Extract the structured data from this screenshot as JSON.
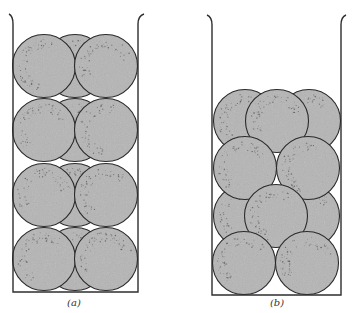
{
  "figure": {
    "colors": {
      "background": "#ffffff",
      "container_stroke": "#2e2e2e",
      "sphere_fill": "#b5b5b5",
      "sphere_stroke": "#2a2a2a",
      "speckle": "#5a5a5a"
    },
    "panels": [
      {
        "id": "a",
        "label": "(a)",
        "label_pos": {
          "x": 74,
          "y": 297
        },
        "description": "Square (simple cubic-like) stacking of spheres in a container",
        "container": {
          "left": 13,
          "right": 138,
          "top": 14,
          "bottom": 292,
          "flare_left": 9,
          "flare_right": 144
        },
        "radius": 31.5,
        "back_spheres": [
          {
            "cx": 75,
            "cy": 66
          },
          {
            "cx": 75,
            "cy": 130
          },
          {
            "cx": 75,
            "cy": 195
          },
          {
            "cx": 75,
            "cy": 259
          }
        ],
        "front_spheres": [
          {
            "cx": 44,
            "cy": 66
          },
          {
            "cx": 106,
            "cy": 66
          },
          {
            "cx": 44,
            "cy": 130
          },
          {
            "cx": 106,
            "cy": 130
          },
          {
            "cx": 44,
            "cy": 195
          },
          {
            "cx": 106,
            "cy": 195
          },
          {
            "cx": 44,
            "cy": 259
          },
          {
            "cx": 106,
            "cy": 259
          }
        ]
      },
      {
        "id": "b",
        "label": "(b)",
        "label_pos": {
          "x": 277,
          "y": 297
        },
        "description": "Close (staggered) packing of spheres in a container",
        "container": {
          "left": 212,
          "right": 341,
          "top": 15,
          "bottom": 295,
          "flare_left": 207,
          "flare_right": 346
        },
        "radius": 31.5,
        "back_spheres": [
          {
            "cx": 245,
            "cy": 121
          },
          {
            "cx": 309,
            "cy": 121
          },
          {
            "cx": 245,
            "cy": 216
          },
          {
            "cx": 308,
            "cy": 216
          }
        ],
        "front_spheres": [
          {
            "cx": 277,
            "cy": 121
          },
          {
            "cx": 245,
            "cy": 168
          },
          {
            "cx": 308,
            "cy": 168
          },
          {
            "cx": 276,
            "cy": 216
          },
          {
            "cx": 244,
            "cy": 263
          },
          {
            "cx": 307,
            "cy": 263
          }
        ]
      }
    ]
  }
}
